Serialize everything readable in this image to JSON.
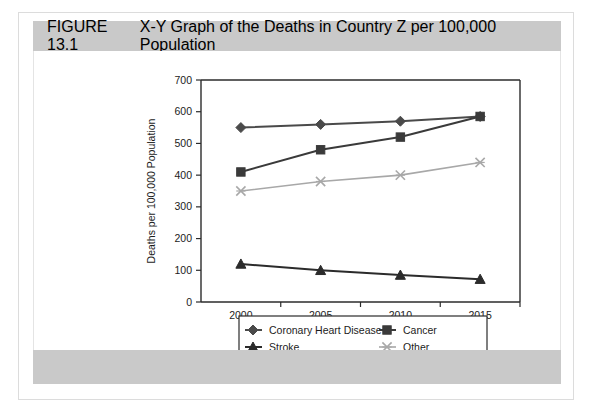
{
  "figure": {
    "number": "FIGURE 13.1",
    "caption": "X-Y Graph of the Deaths in Country Z per 100,000 Population"
  },
  "chart_data": {
    "type": "line",
    "title": "X-Y Graph of the Deaths in Country Z per 100,000 Population",
    "xlabel": "",
    "ylabel": "Deaths per 100,000 Population",
    "x": [
      "2000",
      "2005",
      "2010",
      "2015"
    ],
    "categories": [
      "2000",
      "2005",
      "2010",
      "2015"
    ],
    "xticklabels": [
      "2000",
      "2005",
      "2010",
      "2015"
    ],
    "yticklabels": [
      "0",
      "100",
      "200",
      "300",
      "400",
      "500",
      "600",
      "700"
    ],
    "ylim": [
      0,
      700
    ],
    "ytick_step": 100,
    "grid": false,
    "legend_position": "bottom",
    "series": [
      {
        "name": "Coronary Heart Disease",
        "marker": "diamond",
        "color": "#4a4a4a",
        "values": [
          550,
          560,
          570,
          585
        ]
      },
      {
        "name": "Cancer",
        "marker": "square",
        "color": "#3a3a3a",
        "values": [
          410,
          480,
          520,
          585
        ]
      },
      {
        "name": "Stroke",
        "marker": "triangle",
        "color": "#2b2b2b",
        "values": [
          120,
          100,
          85,
          72
        ]
      },
      {
        "name": "Other",
        "marker": "x",
        "color": "#a8a8a8",
        "values": [
          350,
          380,
          400,
          440
        ]
      }
    ]
  },
  "colors": {
    "title_bar": "#c9c9c9",
    "footer_bar": "#c9c9c9",
    "axis": "#2b2b2b",
    "page_background": "#ffffff"
  }
}
